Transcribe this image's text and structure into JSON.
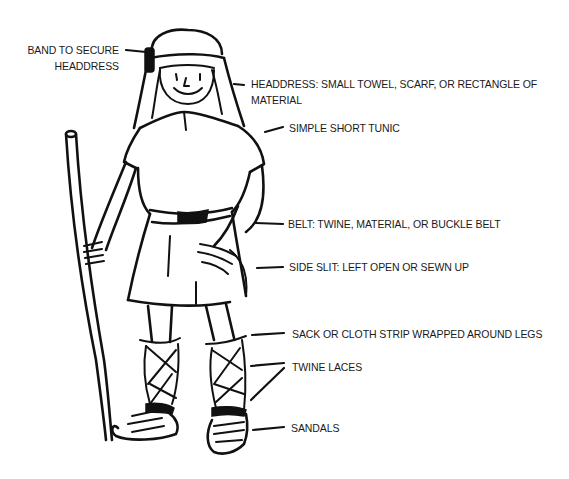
{
  "figure": {
    "labels": {
      "band": [
        "BAND TO SECURE",
        "HEADDRESS"
      ],
      "headdress": [
        "HEADDRESS: SMALL TOWEL, SCARF, OR RECTANGLE OF",
        "MATERIAL"
      ],
      "tunic": "SIMPLE SHORT TUNIC",
      "belt": "BELT: TWINE, MATERIAL, OR BUCKLE BELT",
      "side_slit": "SIDE SLIT: LEFT OPEN OR SEWN UP",
      "leg_wrap": "SACK OR CLOTH STRIP WRAPPED AROUND LEGS",
      "laces": "TWINE LACES",
      "sandals": "SANDALS"
    },
    "colors": {
      "ink": "#111111",
      "paper": "#ffffff"
    }
  }
}
